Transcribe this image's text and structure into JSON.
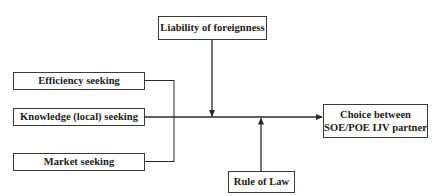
{
  "diagram": {
    "type": "conceptual-model",
    "boxes": {
      "liability": {
        "label": "Liability of foreignness"
      },
      "efficiency": {
        "label": "Efficiency seeking"
      },
      "knowledge": {
        "label": "Knowledge (local) seeking"
      },
      "market": {
        "label": "Market seeking"
      },
      "choice": {
        "line1": "Choice between",
        "line2": "SOE/POE IJV partner"
      },
      "rule_of_law": {
        "label": "Rule of Law"
      }
    },
    "edges": [
      {
        "from": "Efficiency seeking",
        "to": "Choice between SOE/POE IJV partner"
      },
      {
        "from": "Knowledge (local) seeking",
        "to": "Choice between SOE/POE IJV partner"
      },
      {
        "from": "Market seeking",
        "to": "Choice between SOE/POE IJV partner"
      },
      {
        "from": "Liability of foreignness",
        "to": "main relationship",
        "kind": "moderator"
      },
      {
        "from": "Rule of Law",
        "to": "main relationship",
        "kind": "moderator"
      }
    ],
    "colors": {
      "line": "#2a2a2a",
      "border": "#3a3a3a",
      "text": "#1a1a1a",
      "background": "#ffffff"
    }
  }
}
